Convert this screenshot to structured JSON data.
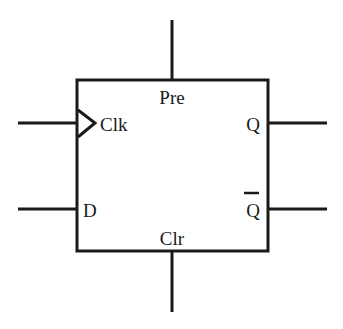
{
  "diagram": {
    "colors": {
      "stroke": "#1a1a1a",
      "background": "#ffffff"
    },
    "pins": {
      "preset": {
        "label": "Pre"
      },
      "clear": {
        "label": "Clr"
      },
      "clock": {
        "label": "Clk",
        "edge_triggered": true
      },
      "data": {
        "label": "D"
      },
      "q": {
        "label": "Q"
      },
      "q_bar": {
        "label": "Q",
        "overbar": true
      }
    }
  }
}
